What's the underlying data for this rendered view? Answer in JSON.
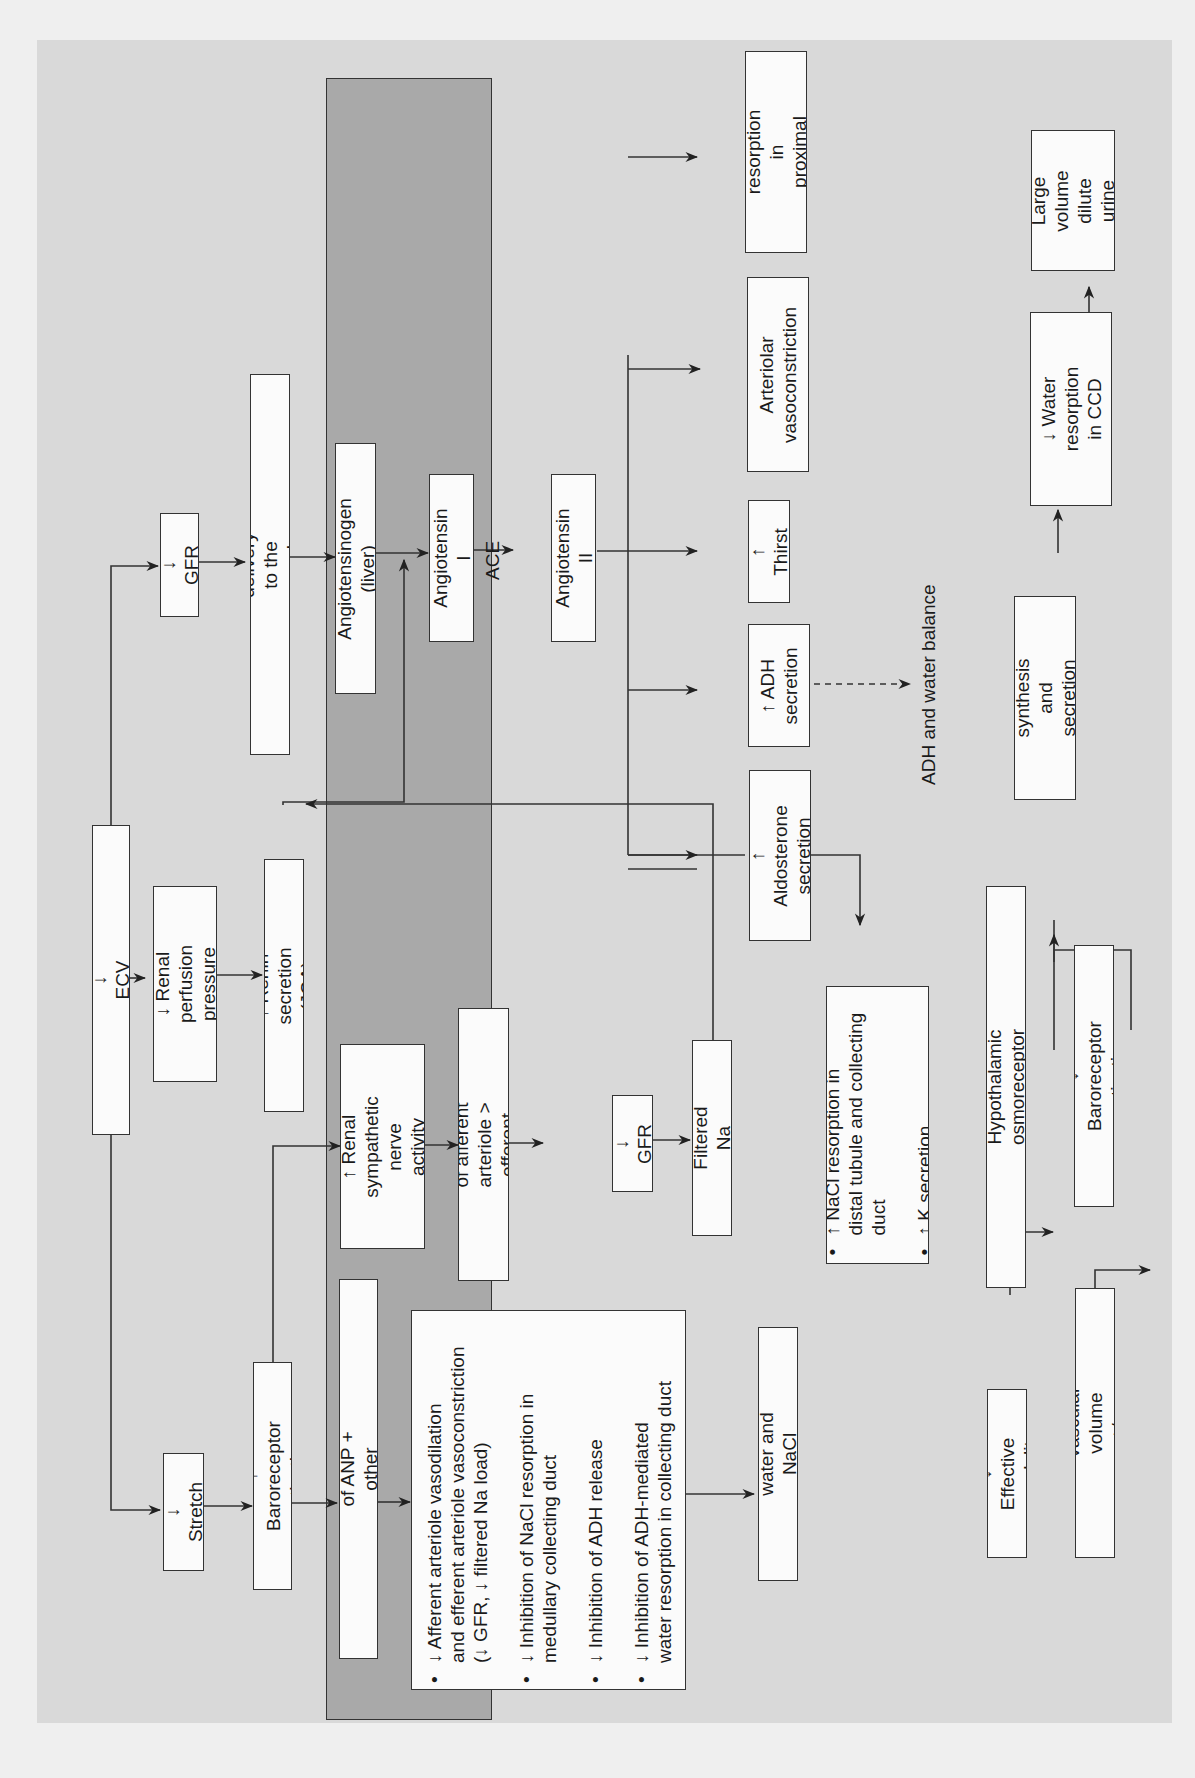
{
  "diagram": {
    "orientation": "rotated-90-ccw",
    "colors": {
      "page_background": "#efefef",
      "panel_background": "#d9d9d9",
      "adh_panel_background": "#a9a9a9",
      "box_fill": "#fbfbfb",
      "line": "#333333"
    },
    "nodes": {
      "ecv": "↓ ECV",
      "stretch": "↓ Stretch",
      "renal_perfusion": "↓ Renal perfusion\npressure",
      "gfr_top": "↓ GFR",
      "baroreceptor": "↑ Baroreceptor activation",
      "renin": "↑ Renin secretion (JGA)",
      "nacl_macula": "↓ NaCl delivery to the macula densa",
      "anp_release": "↓ Release of ANP + other natriuretic peptides",
      "renal_sympathetic": "↑ Renal\nsympathetic nerve\nactivity",
      "angiotensinogen": "Angiotensinogen (liver)",
      "constriction": "Constriction of afferent\narteriole > efferent arteriole",
      "anp_effects": [
        "↓ Afferent arteriole vasodilation\nand efferent arteriole vasoconstriction\n(↓ GFR, ↓ filtered Na load)",
        "↓ Inhibition of NaCl resorption in\nmedullary collecting duct",
        "↓ Inhibition of ADH release",
        "↓ Inhibition of ADH-mediated\nwater resorption in collecting duct"
      ],
      "angiotensin_1": "Angiotensin I",
      "ace_label": "ACE",
      "angiotensin_2": "Angiotensin II",
      "gfr_mid": "↓ GFR",
      "filtered_na": "↑ Filtered Na load",
      "renal_water": "↑ Renal water and NaCl resorption",
      "aldosterone": "↑ Aldosterone\nsecretion",
      "adh_secretion": "↑ ADH\nsecretion",
      "thirst": "↑ Thirst",
      "arteriolar": "Arteriolar\nvasoconstriction",
      "nacl_proximal": "↑ NaCl resorption\nin proximal tubule",
      "nacl_distal": [
        "↑ NaCl resorption in\ndistal tubule and collecting\nduct",
        "↑ K secretion"
      ]
    },
    "adh_panel": {
      "title": "ADH and water balance",
      "nodes": {
        "effective_osmolality": "↓ Effective osmolality",
        "hypothalamic": "↓ Hypothalamic osmoreceptor stimulation",
        "vascular_volume": "↑ Vascular volume +/or pressure",
        "baroreceptor_act": "↓ Baroreceptor activation",
        "adh_synthesis": "↓ ADH synthesis and\nsecretion + ↓ thirst",
        "water_resorption": "↓ Water\nresorption in CCD",
        "dilute_urine": "Large\nvolume\ndilute urine"
      }
    }
  }
}
